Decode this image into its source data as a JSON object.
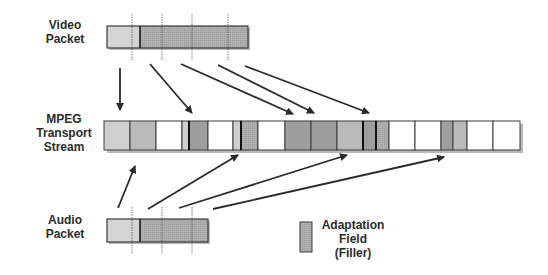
{
  "labels": {
    "video_packet": [
      "Video",
      "Packet"
    ],
    "transport_stream": [
      "MPEG",
      "Transport",
      "Stream"
    ],
    "audio_packet": [
      "Audio",
      "Packet"
    ],
    "legend": [
      "Adaptation",
      "Field",
      "(Filler)"
    ]
  },
  "colors": {
    "header": "#d4d4d4",
    "payload_video": "#a8a8a8",
    "payload_audio": "#b4b4b4",
    "empty": "#ffffff",
    "light": "#cfcfcf",
    "medium": "#bababa",
    "dark": "#9e9e9e",
    "stipple": "#a9a9a9",
    "adaptation": "#a4a4a4",
    "border": "#3a3a3a",
    "arrow": "#2a2a2a",
    "shadow": "#b8b8b8"
  },
  "video_packet": {
    "x": 107,
    "y": 26,
    "w": 141,
    "h": 22,
    "header_end": 140,
    "dividers": [
      132,
      162,
      192,
      228
    ]
  },
  "audio_packet": {
    "x": 107,
    "y": 219,
    "w": 101,
    "h": 23,
    "header_end": 140,
    "dividers": [
      132,
      162,
      192
    ]
  },
  "stream": {
    "x": 104,
    "y": 121,
    "h": 29,
    "cells": [
      {
        "x0": 104,
        "x1": 130,
        "fill": "light"
      },
      {
        "x0": 130,
        "x1": 156,
        "fill": "medium"
      },
      {
        "x0": 156,
        "x1": 182,
        "fill": "empty"
      },
      {
        "x0": 182,
        "x1": 189,
        "fill": "light"
      },
      {
        "x0": 189,
        "x1": 208,
        "fill": "dark",
        "thick_left": true
      },
      {
        "x0": 208,
        "x1": 233,
        "fill": "empty"
      },
      {
        "x0": 233,
        "x1": 241,
        "fill": "light"
      },
      {
        "x0": 241,
        "x1": 258,
        "fill": "stipple",
        "thick_left": true
      },
      {
        "x0": 258,
        "x1": 285,
        "fill": "empty"
      },
      {
        "x0": 285,
        "x1": 311,
        "fill": "dark"
      },
      {
        "x0": 311,
        "x1": 337,
        "fill": "dark"
      },
      {
        "x0": 337,
        "x1": 363,
        "fill": "medium"
      },
      {
        "x0": 363,
        "x1": 376,
        "fill": "dark",
        "thick_left": true
      },
      {
        "x0": 376,
        "x1": 389,
        "fill": "stipple",
        "thick_left": true
      },
      {
        "x0": 389,
        "x1": 415,
        "fill": "empty"
      },
      {
        "x0": 415,
        "x1": 441,
        "fill": "empty"
      },
      {
        "x0": 441,
        "x1": 453,
        "fill": "dark"
      },
      {
        "x0": 453,
        "x1": 467,
        "fill": "medium"
      },
      {
        "x0": 467,
        "x1": 493,
        "fill": "empty"
      },
      {
        "x0": 493,
        "x1": 520,
        "fill": "empty"
      }
    ]
  },
  "arrows": {
    "video": [
      {
        "x1": 120,
        "y1": 68,
        "x2": 120,
        "y2": 110
      },
      {
        "x1": 150,
        "y1": 64,
        "x2": 192,
        "y2": 113
      },
      {
        "x1": 181,
        "y1": 64,
        "x2": 293,
        "y2": 114
      },
      {
        "x1": 218,
        "y1": 65,
        "x2": 314,
        "y2": 113
      },
      {
        "x1": 245,
        "y1": 66,
        "x2": 369,
        "y2": 113
      }
    ],
    "audio": [
      {
        "x1": 118,
        "y1": 208,
        "x2": 135,
        "y2": 166
      },
      {
        "x1": 148,
        "y1": 209,
        "x2": 238,
        "y2": 155
      },
      {
        "x1": 179,
        "y1": 208,
        "x2": 347,
        "y2": 155
      },
      {
        "x1": 213,
        "y1": 209,
        "x2": 444,
        "y2": 157
      }
    ]
  },
  "legend_box": {
    "x": 300,
    "y": 222,
    "w": 12,
    "h": 30
  }
}
